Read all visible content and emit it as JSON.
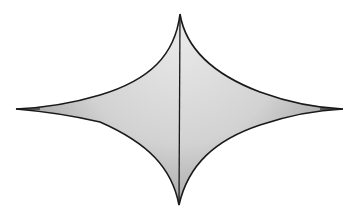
{
  "diagram": {
    "shape": "astroid",
    "cusps": {
      "top": [
        180,
        14
      ],
      "bottom": [
        179,
        205
      ],
      "left": [
        16,
        109
      ],
      "right": [
        343,
        109
      ]
    },
    "colors": {
      "background": "#ffffff",
      "outline": "#1a1a1a",
      "fill_light": "#e6e6e6",
      "fill_mid": "#cfcfcf",
      "fill_dark": "#9a9a9a"
    },
    "stroke_width": 1.6
  }
}
